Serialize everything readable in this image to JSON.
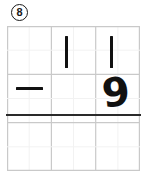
{
  "problem": {
    "number": "8",
    "badge_shape": "circle",
    "type": "vertical-subtraction"
  },
  "worksheet": {
    "background_color": "#ffffff",
    "ink_color": "#111111",
    "grid_minor_color": "#f0f0f0",
    "grid_major_color": "#d6d6d6",
    "answer_rule_color": "#2a2a2a"
  },
  "grid": {
    "columns": 6,
    "rows": 6,
    "cell_width": 22.2,
    "cell_height": 24.2,
    "major_every_columns": 2,
    "major_every_rows": 2,
    "show_border": true
  },
  "math": {
    "minuend": "11",
    "subtrahend": "9",
    "operator": "−",
    "answer": "",
    "answer_blank": true,
    "minuend_digits": [
      {
        "label": "1",
        "glyph": "vertical-stroke",
        "column": 3
      },
      {
        "label": "1",
        "glyph": "vertical-stroke",
        "column": 5
      }
    ],
    "subtrahend_digits": [
      {
        "label": "9",
        "glyph": "handwritten-nine",
        "column": 5
      }
    ],
    "operator_column": 1
  },
  "marks": {
    "digit_one_first": {
      "left": 65,
      "top": 10,
      "height": 32
    },
    "digit_one_second": {
      "left": 110,
      "top": 10,
      "height": 32
    },
    "minus_sign": {
      "left": 12,
      "top": 60,
      "width": 26
    },
    "digit_nine": {
      "left": 98,
      "top": 45,
      "size": 42
    },
    "answer_line": {
      "left": 0,
      "top": 89,
      "width": 133,
      "thickness": 1.9
    }
  }
}
